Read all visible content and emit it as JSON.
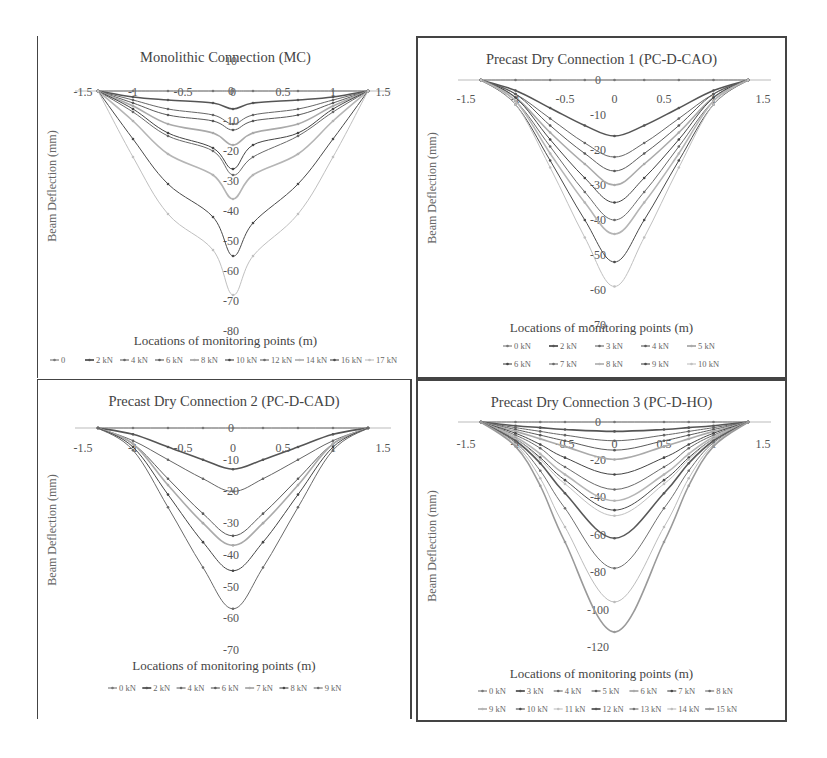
{
  "figure": {
    "panels": [
      {
        "id": "mc",
        "title": "Monolithic Connection (MC)"
      },
      {
        "id": "cao",
        "title": "Precast Dry Connection 1 (PC-D-CAO)"
      },
      {
        "id": "cad",
        "title": "Precast Dry Connection 2 (PC-D-CAD)"
      },
      {
        "id": "ho",
        "title": "Precast Dry Connection 3 (PC-D-HO)"
      }
    ]
  },
  "chart_data": [
    {
      "type": "line",
      "title": "Monolithic Connection (MC)",
      "xlabel": "Locations of monitoring points (m)",
      "ylabel": "Beam Deflection (mm)",
      "xlim": [
        -1.5,
        1.5
      ],
      "ylim": [
        -80,
        10
      ],
      "xticks": [
        "-1.5",
        "-1",
        "-0.5",
        "0",
        "0.5",
        "1",
        "1.5"
      ],
      "yticks": [
        "10",
        "0",
        "-10",
        "-20",
        "-30",
        "-40",
        "-50",
        "-60",
        "-70",
        "-80"
      ],
      "grid": false,
      "legend_position": "bottom",
      "x": [
        -1.35,
        -1.0,
        -0.65,
        -0.2,
        0,
        0.2,
        0.65,
        1.0,
        1.35
      ],
      "series": [
        {
          "name": "0",
          "values": [
            0,
            0,
            0,
            0,
            0,
            0,
            0,
            0,
            0
          ]
        },
        {
          "name": "2 kN",
          "values": [
            0,
            -2,
            -3,
            -4,
            -6,
            -4,
            -3,
            -2,
            0
          ]
        },
        {
          "name": "4 kN",
          "values": [
            0,
            -3,
            -6,
            -8,
            -11,
            -8,
            -6,
            -3,
            0
          ]
        },
        {
          "name": "6 kN",
          "values": [
            0,
            -4,
            -8,
            -10,
            -13,
            -10,
            -8,
            -4,
            0
          ]
        },
        {
          "name": "8 kN",
          "values": [
            0,
            -5,
            -11,
            -14,
            -18,
            -14,
            -11,
            -5,
            0
          ]
        },
        {
          "name": "10 kN",
          "values": [
            0,
            -6,
            -14,
            -19,
            -26,
            -18,
            -14,
            -6,
            0
          ]
        },
        {
          "name": "12 kN",
          "values": [
            0,
            -7,
            -15,
            -20,
            -28,
            -22,
            -15,
            -7,
            0
          ]
        },
        {
          "name": "14 kN",
          "values": [
            0,
            -10,
            -21,
            -28,
            -36,
            -28,
            -21,
            -10,
            0
          ]
        },
        {
          "name": "16 kN",
          "values": [
            0,
            -16,
            -31,
            -42,
            -55,
            -44,
            -31,
            -16,
            0
          ]
        },
        {
          "name": "17 kN",
          "values": [
            0,
            -22,
            -41,
            -53,
            -68,
            -55,
            -41,
            -22,
            0
          ]
        }
      ]
    },
    {
      "type": "line",
      "title": "Precast Dry Connection 1 (PC-D-CAO)",
      "xlabel": "Locations of monitoring points (m)",
      "ylabel": "Beam Deflection (mm)",
      "xlim": [
        -1.5,
        1.5
      ],
      "ylim": [
        -70,
        0
      ],
      "xticks": [
        "-1.5",
        "-1",
        "-0.5",
        "0",
        "0.5",
        "1",
        "1.5"
      ],
      "yticks": [
        "0",
        "-10",
        "-20",
        "-30",
        "-40",
        "-50",
        "-60",
        "-70"
      ],
      "grid": false,
      "legend_position": "bottom",
      "x": [
        -1.35,
        -1.0,
        -0.65,
        -0.3,
        0,
        0.3,
        0.65,
        1.0,
        1.35
      ],
      "series": [
        {
          "name": "0 kN",
          "values": [
            0,
            0,
            0,
            0,
            0,
            0,
            0,
            0,
            0
          ]
        },
        {
          "name": "2 kN",
          "values": [
            0,
            -3,
            -8,
            -13,
            -16,
            -13,
            -8,
            -3,
            0
          ]
        },
        {
          "name": "3 kN",
          "values": [
            0,
            -4,
            -11,
            -18,
            -22,
            -18,
            -11,
            -4,
            0
          ]
        },
        {
          "name": "4 kN",
          "values": [
            0,
            -4,
            -13,
            -21,
            -26,
            -21,
            -13,
            -4,
            0
          ]
        },
        {
          "name": "5 kN",
          "values": [
            0,
            -5,
            -15,
            -24,
            -30,
            -24,
            -15,
            -5,
            0
          ]
        },
        {
          "name": "6 kN",
          "values": [
            0,
            -5,
            -17,
            -28,
            -35,
            -28,
            -17,
            -5,
            0
          ]
        },
        {
          "name": "7 kN",
          "values": [
            0,
            -6,
            -19,
            -32,
            -40,
            -32,
            -19,
            -6,
            0
          ]
        },
        {
          "name": "8 kN",
          "values": [
            0,
            -6,
            -21,
            -35,
            -44,
            -35,
            -21,
            -6,
            0
          ]
        },
        {
          "name": "9 kN",
          "values": [
            0,
            -7,
            -23,
            -40,
            -52,
            -40,
            -23,
            -7,
            0
          ]
        },
        {
          "name": "10 kN",
          "values": [
            0,
            -7,
            -25,
            -45,
            -59,
            -45,
            -25,
            -7,
            0
          ]
        }
      ]
    },
    {
      "type": "line",
      "title": "Precast Dry Connection 2 (PC-D-CAD)",
      "xlabel": "Locations of monitoring points (m)",
      "ylabel": "Beam Deflection (mm)",
      "xlim": [
        -1.5,
        1.5
      ],
      "ylim": [
        -70,
        0
      ],
      "xticks": [
        "-1.5",
        "-1",
        "-0.5",
        "0",
        "0.5",
        "1",
        "1.5"
      ],
      "yticks": [
        "0",
        "-10",
        "-20",
        "-30",
        "-40",
        "-50",
        "-60",
        "-70"
      ],
      "grid": false,
      "legend_position": "bottom",
      "x": [
        -1.35,
        -1.0,
        -0.65,
        -0.3,
        0,
        0.3,
        0.65,
        1.0,
        1.35
      ],
      "series": [
        {
          "name": "0 kN",
          "values": [
            0,
            0,
            0,
            0,
            0,
            0,
            0,
            0,
            0
          ]
        },
        {
          "name": "2 kN",
          "values": [
            0,
            -2,
            -6,
            -10,
            -13,
            -10,
            -6,
            -2,
            0
          ]
        },
        {
          "name": "4 kN",
          "values": [
            0,
            -4,
            -10,
            -16,
            -20,
            -16,
            -10,
            -4,
            0
          ]
        },
        {
          "name": "6 kN",
          "values": [
            0,
            -5,
            -16,
            -27,
            -34,
            -27,
            -16,
            -5,
            0
          ]
        },
        {
          "name": "7 kN",
          "values": [
            0,
            -5,
            -18,
            -30,
            -37,
            -30,
            -18,
            -5,
            0
          ]
        },
        {
          "name": "8 kN",
          "values": [
            0,
            -6,
            -21,
            -36,
            -45,
            -36,
            -21,
            -6,
            0
          ]
        },
        {
          "name": "9 kN",
          "values": [
            0,
            -7,
            -25,
            -44,
            -57,
            -44,
            -25,
            -7,
            0
          ]
        }
      ]
    },
    {
      "type": "line",
      "title": "Precast Dry Connection 3 (PC-D-HO)",
      "xlabel": "Locations of monitoring points (m)",
      "ylabel": "Beam Deflection (mm)",
      "xlim": [
        -1.5,
        1.5
      ],
      "ylim": [
        -120,
        0
      ],
      "xticks": [
        "-1.5",
        "-1",
        "-0.5",
        "0",
        "0.5",
        "1",
        "1.5"
      ],
      "yticks": [
        "0",
        "-20",
        "-40",
        "-60",
        "-80",
        "-100",
        "-120"
      ],
      "grid": false,
      "legend_position": "bottom",
      "x": [
        -1.35,
        -1.0,
        -0.75,
        -0.5,
        0,
        0.5,
        0.75,
        1.0,
        1.35
      ],
      "series": [
        {
          "name": "0 kN",
          "values": [
            0,
            0,
            0,
            0,
            0,
            0,
            0,
            0,
            0
          ]
        },
        {
          "name": "3 kN",
          "values": [
            0,
            -2,
            -3,
            -4,
            -5,
            -4,
            -3,
            -2,
            0
          ]
        },
        {
          "name": "4 kN",
          "values": [
            0,
            -3,
            -5,
            -7,
            -10,
            -7,
            -5,
            -3,
            0
          ]
        },
        {
          "name": "5 kN",
          "values": [
            0,
            -4,
            -7,
            -10,
            -15,
            -10,
            -7,
            -4,
            0
          ]
        },
        {
          "name": "6 kN",
          "values": [
            0,
            -5,
            -9,
            -13,
            -20,
            -13,
            -9,
            -5,
            0
          ]
        },
        {
          "name": "7 kN",
          "values": [
            0,
            -6,
            -12,
            -19,
            -28,
            -19,
            -12,
            -6,
            0
          ]
        },
        {
          "name": "8 kN",
          "values": [
            0,
            -7,
            -14,
            -24,
            -36,
            -24,
            -14,
            -7,
            0
          ]
        },
        {
          "name": "9 kN",
          "values": [
            0,
            -8,
            -17,
            -28,
            -42,
            -28,
            -17,
            -8,
            0
          ]
        },
        {
          "name": "10 kN",
          "values": [
            0,
            -9,
            -19,
            -31,
            -47,
            -31,
            -19,
            -9,
            0
          ]
        },
        {
          "name": "11 kN",
          "values": [
            0,
            -9,
            -20,
            -33,
            -50,
            -33,
            -20,
            -9,
            0
          ]
        },
        {
          "name": "12 kN",
          "values": [
            0,
            -10,
            -22,
            -38,
            -62,
            -38,
            -22,
            -10,
            0
          ]
        },
        {
          "name": "13 kN",
          "values": [
            0,
            -11,
            -26,
            -46,
            -78,
            -46,
            -26,
            -11,
            0
          ]
        },
        {
          "name": "14 kN",
          "values": [
            0,
            -12,
            -30,
            -56,
            -96,
            -56,
            -30,
            -12,
            0
          ]
        },
        {
          "name": "15 kN",
          "values": [
            0,
            -13,
            -34,
            -64,
            -112,
            -64,
            -34,
            -13,
            0
          ]
        }
      ]
    }
  ]
}
